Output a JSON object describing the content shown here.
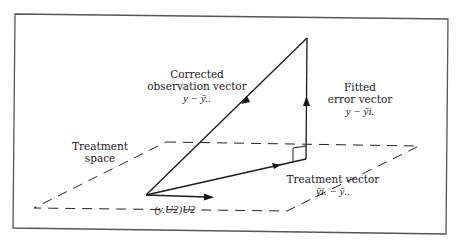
{
  "diagram": {
    "labels": {
      "corrected_obs": {
        "line1": "Corrected",
        "line2": "observation vector",
        "math": "y − ȳ.."
      },
      "fitted_error": {
        "line1": "Fitted",
        "line2": "error vector",
        "math": "y − ȳi."
      },
      "treatment_space": {
        "line1": "Treatment",
        "line2": "space"
      },
      "treatment_vector": {
        "line1": "Treatment vector",
        "math": "ȳi. − ȳ.."
      },
      "u2_projection": {
        "math": "(y.U2)U2"
      }
    },
    "colors": {
      "ink": "#1a1a1a",
      "frame": "#555555",
      "background": "#ffffff"
    }
  }
}
